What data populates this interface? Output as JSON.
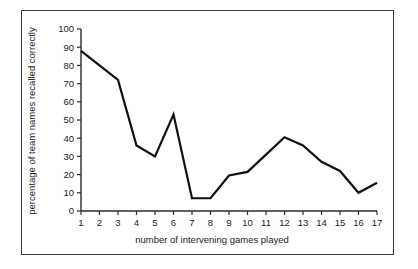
{
  "figure": {
    "background_color": "#ffffff",
    "frame_color": "#3a3a3a",
    "line_color": "#111111"
  },
  "chart_data": {
    "type": "line",
    "title": "",
    "xlabel": "number of intervening games played",
    "ylabel": "percentage of team names recalled correctly",
    "x": [
      1,
      2,
      3,
      4,
      5,
      6,
      7,
      8,
      9,
      10,
      11,
      12,
      13,
      14,
      15,
      16,
      17
    ],
    "values": [
      88,
      80,
      72,
      36,
      30,
      53,
      7,
      7,
      19.5,
      21.5,
      31,
      40.5,
      36,
      27,
      22,
      10,
      15.5
    ],
    "xlim": [
      1,
      17
    ],
    "ylim": [
      0,
      100
    ],
    "xticks": [
      "1",
      "2",
      "3",
      "4",
      "5",
      "6",
      "7",
      "8",
      "9",
      "10",
      "11",
      "12",
      "13",
      "14",
      "15",
      "16",
      "17"
    ],
    "yticks": [
      "0",
      "10",
      "20",
      "30",
      "40",
      "50",
      "60",
      "70",
      "80",
      "90",
      "100"
    ],
    "ytick_values": [
      0,
      10,
      20,
      30,
      40,
      50,
      60,
      70,
      80,
      90,
      100
    ],
    "grid": false,
    "legend": null,
    "legend_position": "none",
    "series_name": "percentage recalled"
  }
}
